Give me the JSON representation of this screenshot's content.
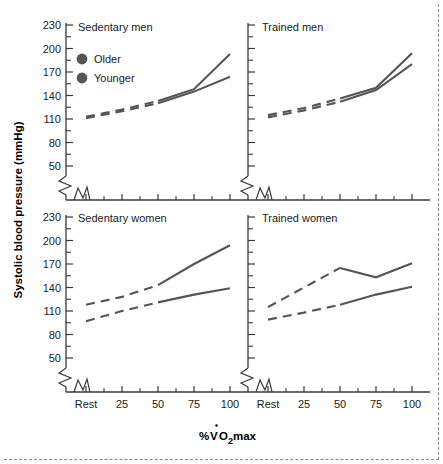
{
  "figure": {
    "y_axis_title": "Systolic blood pressure (mmHg)",
    "x_axis_title_parts": {
      "percent": "%",
      "v": "V",
      "o": "O",
      "two": "2",
      "max": "max"
    },
    "x_axis_title": "%VO2max"
  },
  "legend": {
    "items": [
      {
        "label": "Older",
        "marker": "filled-circle",
        "color": "#555555"
      },
      {
        "label": "Younger",
        "marker": "filled-circle",
        "color": "#555555"
      }
    ]
  },
  "axes": {
    "y_ticklabels": [
      "230",
      "200",
      "170",
      "140",
      "110",
      "80",
      "50"
    ],
    "y_tickvalues": [
      230,
      200,
      170,
      140,
      110,
      80,
      50
    ],
    "x_ticklabels": [
      "Rest",
      "25",
      "50",
      "75",
      "100"
    ],
    "y_axis_break": true,
    "x_axis_break": true,
    "grid": false
  },
  "chart_data": {
    "type": "line",
    "title": "",
    "xlabel": "%VO2max",
    "ylabel": "Systolic blood pressure (mmHg)",
    "ylim": [
      50,
      235
    ],
    "x": [
      "Rest",
      "25",
      "50",
      "75",
      "100"
    ],
    "grid": false,
    "legend_position": "inside-top-left-panel",
    "panels": [
      {
        "name": "Sedentary men",
        "position": "top-left",
        "series": [
          {
            "name": "Older",
            "values": [
              113,
              122,
              133,
              148,
              193
            ],
            "dashed_segment": [
              "Rest",
              "25",
              "50"
            ],
            "solid_segment": [
              "50",
              "75",
              "100"
            ]
          },
          {
            "name": "Younger",
            "values": [
              111,
              120,
              130,
              145,
              164
            ],
            "dashed_segment": [
              "Rest",
              "25",
              "50"
            ],
            "solid_segment": [
              "50",
              "75",
              "100"
            ]
          }
        ]
      },
      {
        "name": "Trained men",
        "position": "top-right",
        "series": [
          {
            "name": "Older",
            "values": [
              115,
              124,
              136,
              150,
              194
            ],
            "dashed_segment": [
              "Rest",
              "25",
              "50"
            ],
            "solid_segment": [
              "50",
              "75",
              "100"
            ]
          },
          {
            "name": "Younger",
            "values": [
              112,
              121,
              132,
              147,
              180
            ],
            "dashed_segment": [
              "Rest",
              "25",
              "50"
            ],
            "solid_segment": [
              "50",
              "75",
              "100"
            ]
          }
        ]
      },
      {
        "name": "Sedentary women",
        "position": "bottom-left",
        "series": [
          {
            "name": "Older",
            "values": [
              118,
              128,
              143,
              170,
              194
            ],
            "dashed_segment": [
              "Rest",
              "25",
              "50"
            ],
            "solid_segment": [
              "50",
              "75",
              "100"
            ]
          },
          {
            "name": "Younger",
            "values": [
              97,
              110,
              121,
              131,
              139
            ],
            "dashed_segment": [
              "Rest",
              "25",
              "50"
            ],
            "solid_segment": [
              "50",
              "75",
              "100"
            ]
          }
        ]
      },
      {
        "name": "Trained women",
        "position": "bottom-right",
        "series": [
          {
            "name": "Older",
            "values": [
              115,
              140,
              165,
              153,
              171
            ],
            "dashed_segment": [
              "Rest",
              "25",
              "50"
            ],
            "solid_segment": [
              "50",
              "75",
              "100"
            ]
          },
          {
            "name": "Younger",
            "values": [
              99,
              108,
              118,
              131,
              141
            ],
            "dashed_segment": [
              "Rest",
              "25",
              "50"
            ],
            "solid_segment": [
              "50",
              "75",
              "100"
            ]
          }
        ]
      }
    ]
  },
  "panel_titles": {
    "top_left": "Sedentary men",
    "top_right": "Trained men",
    "bottom_left": "Sedentary women",
    "bottom_right": "Trained women"
  }
}
